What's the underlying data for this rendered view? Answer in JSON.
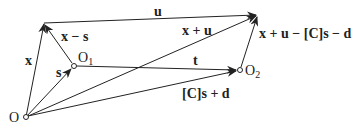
{
  "diagram": {
    "points": {
      "O": {
        "label": "O",
        "x": 26,
        "y": 117
      },
      "O1": {
        "label": "O",
        "sub": "1",
        "x": 74,
        "y": 66
      },
      "O2": {
        "label": "O",
        "sub": "2",
        "x": 240,
        "y": 70
      },
      "X": {
        "x": 44,
        "y": 23
      },
      "U": {
        "x": 258,
        "y": 15
      }
    },
    "vectors": [
      {
        "id": "x",
        "from": "O",
        "to": "X",
        "label": "x"
      },
      {
        "id": "s",
        "from": "O",
        "to": "O1",
        "label": "s"
      },
      {
        "id": "x-s",
        "from": "O1",
        "to": "X",
        "label": "x − s"
      },
      {
        "id": "u",
        "from": "X",
        "to": "U",
        "label": "u"
      },
      {
        "id": "x+u",
        "from": "O",
        "to": "U",
        "label": "x + u"
      },
      {
        "id": "t",
        "from": "O1",
        "to": "O2",
        "label": "t"
      },
      {
        "id": "Cs+d",
        "from": "O",
        "to": "O2",
        "label": "[C]s + d"
      },
      {
        "id": "x+u-Cs-d",
        "from": "O2",
        "to": "U",
        "label": "x + u − [C]s − d"
      }
    ],
    "colors": {
      "stroke": "#222222",
      "background": "#ffffff"
    }
  }
}
